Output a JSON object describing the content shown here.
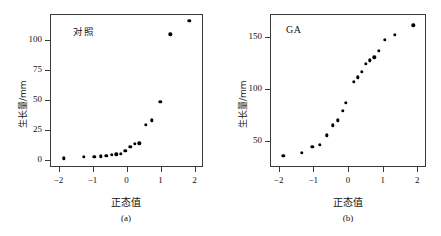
{
  "figure": {
    "axis_label_x": "正态值",
    "axis_label_y": "生长量/mm"
  },
  "panels": [
    {
      "id": "a",
      "title": "对照",
      "caption": "(a)",
      "axis_label_x": "正态值",
      "axis_label_y": "生长量/mm",
      "xticks": [
        "-2",
        "-1",
        "0",
        "1",
        "2"
      ],
      "yticks": [
        "0",
        "25",
        "50",
        "75",
        "100"
      ]
    },
    {
      "id": "b",
      "title": "GA",
      "caption": "(b)",
      "axis_label_x": "正态值",
      "axis_label_y": "生长量/mm",
      "xticks": [
        "-2",
        "-1",
        "0",
        "1",
        "2"
      ],
      "yticks": [
        "50",
        "100",
        "150"
      ]
    }
  ],
  "chart_data": [
    {
      "type": "scatter",
      "id": "panel-a",
      "title": "对照",
      "subtitle": "(a)",
      "xlabel": "正态值",
      "ylabel": "生长量/mm",
      "xlim": [
        -2.25,
        2.25
      ],
      "ylim": [
        -6,
        122
      ],
      "xticks": [
        -2,
        -1,
        0,
        1,
        2
      ],
      "yticks": [
        0,
        25,
        50,
        75,
        100
      ],
      "grid": false,
      "legend": "none",
      "marker": "filled-circle",
      "marker_color": "#000000",
      "x": [
        -1.87,
        -1.29,
        -0.98,
        -0.79,
        -0.62,
        -0.47,
        -0.33,
        -0.19,
        -0.06,
        0.08,
        0.21,
        0.35,
        0.53,
        0.72,
        0.96,
        1.26,
        1.82
      ],
      "y": [
        2.0,
        3.2,
        3.5,
        3.8,
        4.2,
        5.0,
        5.6,
        6.0,
        8.5,
        11.5,
        14.0,
        14.5,
        30.0,
        34.0,
        49.5,
        106.0,
        117.0
      ]
    },
    {
      "type": "scatter",
      "id": "panel-b",
      "title": "GA",
      "subtitle": "(b)",
      "xlabel": "正态值",
      "ylabel": "生长量/mm",
      "xlim": [
        -2.25,
        2.25
      ],
      "ylim": [
        25,
        172
      ],
      "xticks": [
        -2,
        -1,
        0,
        1,
        2
      ],
      "yticks": [
        50,
        100,
        150
      ],
      "grid": false,
      "legend": "none",
      "marker": "filled-circle",
      "marker_color": "#000000",
      "x": [
        -1.9,
        -1.36,
        -1.06,
        -0.85,
        -0.64,
        -0.46,
        -0.32,
        -0.17,
        -0.09,
        0.14,
        0.25,
        0.37,
        0.48,
        0.6,
        0.73,
        0.86,
        1.03,
        1.33,
        1.86
      ],
      "y": [
        37.0,
        39.5,
        45.5,
        47.0,
        56.5,
        66.0,
        71.0,
        80.0,
        87.5,
        108.0,
        112.0,
        117.5,
        125.0,
        128.5,
        131.5,
        137.5,
        148.0,
        153.0,
        162.0
      ]
    }
  ]
}
